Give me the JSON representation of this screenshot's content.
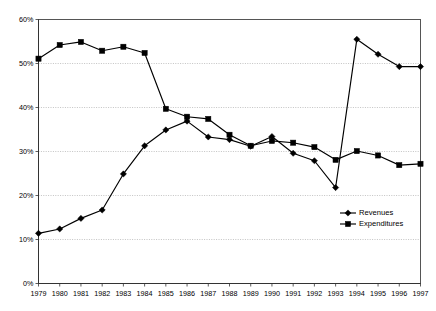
{
  "chart_data": {
    "type": "line",
    "title": "",
    "subtitle": "",
    "xlabel": "",
    "ylabel": "",
    "grid": true,
    "legend_position": "inside-right",
    "x": [
      1979,
      1980,
      1981,
      1982,
      1983,
      1984,
      1985,
      1986,
      1987,
      1988,
      1989,
      1990,
      1991,
      1992,
      1993,
      1994,
      1995,
      1996,
      1997
    ],
    "categories": [
      "1979",
      "1980",
      "1981",
      "1982",
      "1983",
      "1984",
      "1985",
      "1986",
      "1987",
      "1988",
      "1989",
      "1990",
      "1991",
      "1992",
      "1993",
      "1994",
      "1995",
      "1996",
      "1997"
    ],
    "ylim": [
      0,
      60
    ],
    "yticks": [
      0,
      10,
      20,
      30,
      40,
      50,
      60
    ],
    "ytick_labels": [
      "0%",
      "10%",
      "20%",
      "30%",
      "40%",
      "50%",
      "60%"
    ],
    "series": [
      {
        "name": "Revenues",
        "marker": "diamond",
        "color": "#000000",
        "values": [
          11.4,
          12.4,
          14.8,
          16.7,
          24.9,
          31.3,
          34.9,
          36.9,
          33.3,
          32.7,
          31.2,
          33.4,
          29.6,
          27.9,
          21.8,
          55.5,
          52.1,
          49.3,
          49.3
        ]
      },
      {
        "name": "Expenditures",
        "marker": "square",
        "color": "#000000",
        "values": [
          51.1,
          54.2,
          54.9,
          52.9,
          53.8,
          52.4,
          39.7,
          37.9,
          37.4,
          33.8,
          31.3,
          32.4,
          32.0,
          31.0,
          28.1,
          30.1,
          29.1,
          26.9,
          27.2
        ]
      }
    ]
  },
  "legend": {
    "items": [
      {
        "label": "Revenues",
        "marker": "diamond"
      },
      {
        "label": "Expenditures",
        "marker": "square"
      }
    ]
  },
  "colors": {
    "series": "#000000",
    "grid": "#9a9a9a",
    "frame": "#555555",
    "background": "#ffffff"
  }
}
